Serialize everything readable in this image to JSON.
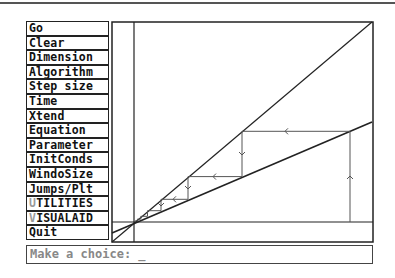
{
  "menu": {
    "items": [
      {
        "label": "Go",
        "hotkey_prefix": "",
        "rest": "Go"
      },
      {
        "label": "Clear",
        "hotkey_prefix": "",
        "rest": "Clear"
      },
      {
        "label": "Dimension",
        "hotkey_prefix": "",
        "rest": "Dimension"
      },
      {
        "label": "Algorithm",
        "hotkey_prefix": "",
        "rest": "Algorithm"
      },
      {
        "label": "Step size",
        "hotkey_prefix": "",
        "rest": "Step size"
      },
      {
        "label": "Time",
        "hotkey_prefix": "",
        "rest": "Time"
      },
      {
        "label": "Xtend",
        "hotkey_prefix": "",
        "rest": "Xtend"
      },
      {
        "label": "Equation",
        "hotkey_prefix": "",
        "rest": "Equation"
      },
      {
        "label": "Parameter",
        "hotkey_prefix": "",
        "rest": "Parameter"
      },
      {
        "label": "InitConds",
        "hotkey_prefix": "",
        "rest": "InitConds"
      },
      {
        "label": "WindoSize",
        "hotkey_prefix": "",
        "rest": "WindoSize"
      },
      {
        "label": "Jumps/Plt",
        "hotkey_prefix": "",
        "rest": "Jumps/Plt"
      },
      {
        "label": "UTILITIES",
        "hotkey_prefix": "U",
        "rest": "TILITIES"
      },
      {
        "label": "VISUALAID",
        "hotkey_prefix": "V",
        "rest": "ISUALAID"
      },
      {
        "label": "Quit",
        "hotkey_prefix": "",
        "rest": "Quit"
      }
    ]
  },
  "prompt": {
    "text": "Make a choice: _"
  },
  "plot": {
    "description": "Cobweb diagram: diagonal y=x line and a lower-slope map line meeting at fixed point; orbit spirals in toward fixed point",
    "colors": {
      "frame": "#222222",
      "lines": "#222222",
      "cobweb": "#555555"
    },
    "frame": {
      "x": 1,
      "y": 1,
      "w": 261,
      "h": 220
    },
    "axes": {
      "vertical_x": 23,
      "horizontal_y": 201
    },
    "diagonal": {
      "x1": 1,
      "y1": 221,
      "x2": 261,
      "y2": 1
    },
    "map_line": {
      "x1": 1,
      "y1": 212,
      "x2": 261,
      "y2": 101
    },
    "cobweb_points": [
      [
        239,
        201
      ],
      [
        239,
        110.3
      ],
      [
        131,
        110.3
      ],
      [
        131,
        155.6
      ],
      [
        77,
        155.6
      ],
      [
        77,
        178.3
      ],
      [
        50,
        178.3
      ],
      [
        50,
        189.7
      ],
      [
        36.5,
        189.7
      ],
      [
        36.5,
        195.3
      ],
      [
        29.8,
        195.3
      ],
      [
        29.8,
        198.1
      ],
      [
        26.4,
        198.1
      ],
      [
        26.4,
        199.6
      ],
      [
        24.7,
        199.6
      ],
      [
        24.7,
        200.3
      ],
      [
        23.8,
        200.3
      ]
    ],
    "arrows": [
      {
        "dir": "up",
        "x": 239,
        "y": 155
      },
      {
        "dir": "left",
        "x": 174,
        "y": 110.3
      },
      {
        "dir": "down",
        "x": 131,
        "y": 134
      },
      {
        "dir": "left",
        "x": 102,
        "y": 155.6
      },
      {
        "dir": "down",
        "x": 77,
        "y": 168
      },
      {
        "dir": "left",
        "x": 62,
        "y": 178.3
      },
      {
        "dir": "down",
        "x": 50,
        "y": 185
      }
    ]
  }
}
